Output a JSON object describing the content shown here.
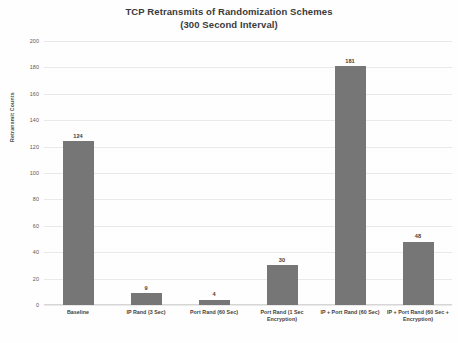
{
  "chart_data": {
    "type": "bar",
    "title": "TCP Retransmits of Randomization Schemes (300 Second Interval)",
    "title_line1": "TCP Retransmits of Randomization Schemes",
    "title_line2": "(300 Second Interval)",
    "xlabel": "",
    "ylabel": "Retransmit Counts",
    "categories": [
      "Baseline",
      "IP Rand (3 Sec)",
      "Port Rand (60 Sec)",
      "Port Rand (1 Sec Encryption)",
      "IP + Port Rand (60 Sec)",
      "IP + Port Rand (60 Sec + Encryption)"
    ],
    "values": [
      124,
      9,
      4,
      30,
      181,
      48
    ],
    "value_labels": [
      "124",
      "9",
      "4",
      "30",
      "181",
      "48"
    ],
    "ylim": [
      0,
      200
    ],
    "ytick_values": [
      0,
      20,
      40,
      60,
      80,
      100,
      120,
      140,
      160,
      180,
      200
    ],
    "ytick_labels": [
      "0",
      "20",
      "40",
      "60",
      "80",
      "100",
      "120",
      "140",
      "160",
      "180",
      "200"
    ],
    "grid": true,
    "legend": false,
    "bar_color": "#767676",
    "grid_color": "#e9e9e9",
    "background_color": "#fefefe",
    "text_color": "#3d3d3d"
  }
}
